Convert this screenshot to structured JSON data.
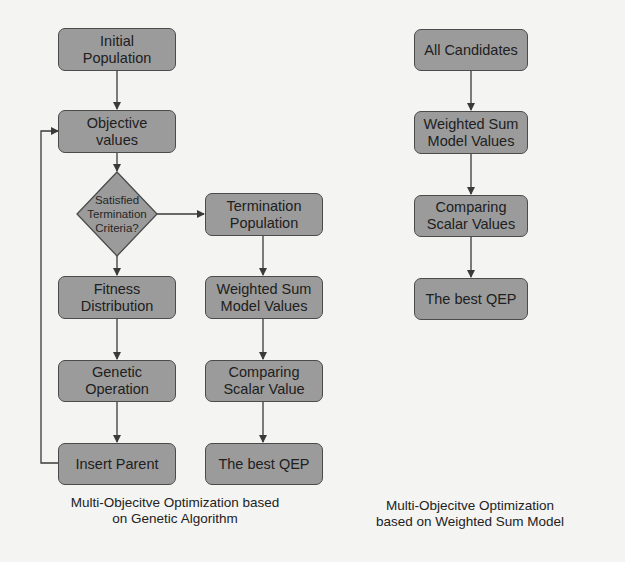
{
  "diagram_left": {
    "title": "Multi-Objecitve Optimization based\non Genetic Algorithm",
    "nodes": {
      "initial_population": "Initial\nPopulation",
      "objective_values": "Objective\nvalues",
      "decision": "Satisfied\nTermination\nCriteria?",
      "fitness_distribution": "Fitness\nDistribution",
      "genetic_operation": "Genetic\nOperation",
      "insert_parent": "Insert Parent",
      "termination_population": "Termination\nPopulation",
      "weighted_sum": "Weighted Sum\nModel Values",
      "comparing_scalar": "Comparing\nScalar Value",
      "best_qep": "The best QEP"
    }
  },
  "diagram_right": {
    "title": "Multi-Objecitve Optimization\nbased on Weighted Sum Model",
    "nodes": {
      "all_candidates": "All Candidates",
      "weighted_sum": "Weighted Sum\nModel Values",
      "comparing_scalar": "Comparing\nScalar Values",
      "best_qep": "The best QEP"
    }
  },
  "colors": {
    "node_fill": "#9b9b9b",
    "node_border": "#4b4b4b",
    "edge": "#3a3a3a",
    "background": "#f4f4f2"
  }
}
